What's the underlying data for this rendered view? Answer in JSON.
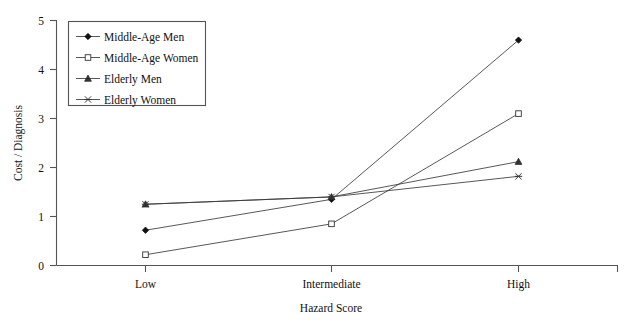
{
  "chart_data": {
    "type": "line",
    "title": "",
    "xlabel": "Hazard Score",
    "ylabel": "Cost / Diagnosis",
    "categories": [
      "Low",
      "Intermediate",
      "High"
    ],
    "ylim": [
      0,
      5
    ],
    "yticks": [
      "0",
      "1",
      "2",
      "3",
      "4",
      "5"
    ],
    "grid": false,
    "legend_position": "top-left",
    "series": [
      {
        "name": "Middle-Age Men",
        "marker": "filled-diamond",
        "values": [
          0.72,
          1.35,
          4.6
        ]
      },
      {
        "name": "Middle-Age Women",
        "marker": "open-square",
        "values": [
          0.22,
          0.85,
          3.1
        ]
      },
      {
        "name": "Elderly Men",
        "marker": "filled-triangle",
        "values": [
          1.25,
          1.4,
          2.12
        ]
      },
      {
        "name": "Elderly Women",
        "marker": "cross-x",
        "values": [
          1.25,
          1.4,
          1.82
        ]
      }
    ]
  },
  "axes": {
    "y_tick_0": "0",
    "y_tick_1": "1",
    "y_tick_2": "2",
    "y_tick_3": "3",
    "y_tick_4": "4",
    "y_tick_5": "5",
    "y_title": "Cost / Diagnosis",
    "x_title": "Hazard Score",
    "x_cat_0": "Low",
    "x_cat_1": "Intermediate",
    "x_cat_2": "High"
  },
  "legend": {
    "entries": [
      {
        "label": "Middle-Age Men"
      },
      {
        "label": "Middle-Age Women"
      },
      {
        "label": "Elderly Men"
      },
      {
        "label": "Elderly Women"
      }
    ]
  },
  "colors": {
    "line": "#3a3a3a",
    "axis": "#555555",
    "text": "#111111",
    "background": "#ffffff"
  }
}
